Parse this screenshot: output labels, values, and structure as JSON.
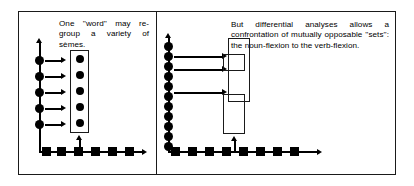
{
  "figure": {
    "panels": [
      {
        "id": "left",
        "caption": "One ''word'' may re-group a variety of sèmes.",
        "chain_dots": 5,
        "grouped_circles": 5,
        "base_squares": 6,
        "arrows_right": 5,
        "arrows_up": 1
      },
      {
        "id": "right",
        "caption": "But differential analyses allows a confrontation of mutually opposable ''sets'': the noun-flexion to the verb-flexion.",
        "chain_dots": 11,
        "base_squares": 8,
        "arrows_right": 3,
        "arrows_up": 1,
        "set_boxes": 3
      }
    ]
  },
  "colors": {
    "ink": "#000000",
    "frame": "#1a1a1a",
    "paper": "#ffffff"
  }
}
